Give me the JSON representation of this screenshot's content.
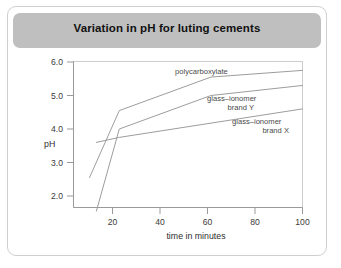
{
  "figure": {
    "title": "Variation in pH for luting cements",
    "header_color": "#bfbfbf",
    "frame_color": "#cfcfcf",
    "background": "#ffffff"
  },
  "chart_data": {
    "type": "line",
    "title": "Variation in pH for luting cements",
    "xlabel": "time in minutes",
    "ylabel": "pH",
    "xlim": [
      0,
      100
    ],
    "ylim": [
      1.4,
      6.0
    ],
    "xticks": [
      20,
      40,
      60,
      80,
      100
    ],
    "xticklabels": [
      "20",
      "40",
      "60",
      "80",
      "100"
    ],
    "yticks": [
      2.0,
      3.0,
      4.0,
      5.0,
      6.0
    ],
    "yticklabels": [
      "2.0",
      "3.0",
      "4.0",
      "5.0",
      "6.0"
    ],
    "grid": false,
    "legend": "inline-labels",
    "line_color": "#9d9d9d",
    "series": [
      {
        "name": "polycarboxylate",
        "label": "polycarboxylate",
        "x": [
          7,
          20,
          60,
          100
        ],
        "values": [
          2.55,
          4.55,
          5.55,
          5.75
        ]
      },
      {
        "name": "glass-ionomer brand Y",
        "label_line1": "glass–ionomer",
        "label_line2": "brand Y",
        "x": [
          10,
          20,
          60,
          100
        ],
        "values": [
          1.55,
          4.0,
          5.0,
          5.3
        ]
      },
      {
        "name": "glass-ionomer brand X",
        "label_line1": "glass–ionomer",
        "label_line2": "brand X",
        "x": [
          10,
          20,
          100
        ],
        "values": [
          3.6,
          3.75,
          4.6
        ]
      }
    ]
  },
  "axis": {
    "y_title": "pH",
    "x_title": "time in minutes"
  },
  "labels": {
    "polycarboxylate": "polycarboxylate",
    "giy_line1": "glass–ionomer",
    "giy_line2": "brand Y",
    "gix_line1": "glass–ionomer",
    "gix_line2": "brand X"
  }
}
